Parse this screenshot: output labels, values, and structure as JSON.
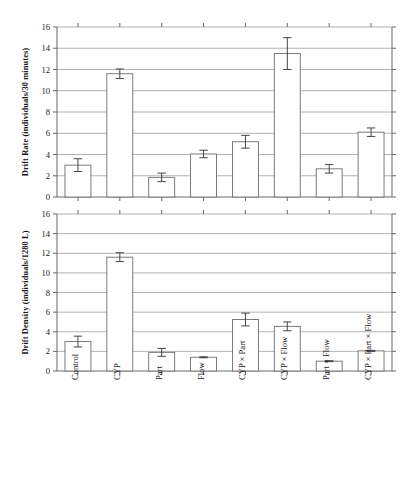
{
  "figure": {
    "background": "#ffffff",
    "bar_fill": "#ffffff",
    "bar_stroke": "#6d6d6d",
    "grid_color": "#9a9a9a",
    "error_bar_color": "#3d3d3d"
  },
  "categories": [
    "Control",
    "CYP",
    "Part",
    "Flow",
    "CYP × Part",
    "CYP × Flow",
    "Part × Flow",
    "CYP × Part × Flow"
  ],
  "y_ticks": [
    "0",
    "2",
    "4",
    "6",
    "8",
    "10",
    "12",
    "14",
    "16"
  ],
  "panels": [
    {
      "id": "drift-rate",
      "ylabel": "Drift Rate (individuals/30 minutes)",
      "show_category_labels": false
    },
    {
      "id": "drift-density",
      "ylabel": "Drift Density (individuals/1280 L)",
      "show_category_labels": true
    }
  ],
  "chart_data": [
    {
      "type": "bar",
      "title": "",
      "xlabel": "",
      "ylabel": "Drift Rate (individuals/30 minutes)",
      "ylim": [
        0,
        16
      ],
      "ytick_step": 2,
      "grid": true,
      "legend": "none",
      "categories": [
        "Control",
        "CYP",
        "Part",
        "Flow",
        "CYP × Part",
        "CYP × Flow",
        "Part × Flow",
        "CYP × Part × Flow"
      ],
      "values": [
        3.0,
        11.6,
        1.85,
        4.05,
        5.2,
        13.5,
        2.65,
        6.1
      ],
      "errors": [
        0.6,
        0.45,
        0.4,
        0.35,
        0.6,
        1.5,
        0.4,
        0.4
      ]
    },
    {
      "type": "bar",
      "title": "",
      "xlabel": "",
      "ylabel": "Drift Density (individuals/1280 L)",
      "ylim": [
        0,
        16
      ],
      "ytick_step": 2,
      "grid": true,
      "legend": "none",
      "categories": [
        "Control",
        "CYP",
        "Part",
        "Flow",
        "CYP × Part",
        "CYP × Flow",
        "Part × Flow",
        "CYP × Part × Flow"
      ],
      "values": [
        3.0,
        11.6,
        1.9,
        1.4,
        5.25,
        4.55,
        1.0,
        2.05
      ],
      "errors": [
        0.55,
        0.45,
        0.4,
        0.05,
        0.65,
        0.45,
        0.05,
        0.05
      ]
    }
  ]
}
